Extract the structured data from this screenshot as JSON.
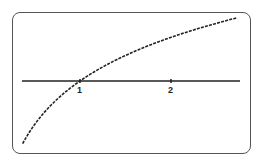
{
  "chart_data": {
    "type": "line",
    "title": "",
    "xlabel": "",
    "ylabel": "",
    "function": "y = ln(x)",
    "xlim": [
      0.37,
      2.72
    ],
    "ylim": [
      -1.0,
      1.0
    ],
    "x_ticks": [
      {
        "value": 1,
        "label": "1"
      },
      {
        "value": 2,
        "label": "2"
      }
    ],
    "series": [
      {
        "name": "ln(x)",
        "x": [
          0.37,
          0.5,
          0.75,
          1.0,
          1.25,
          1.5,
          1.75,
          2.0,
          2.25,
          2.5,
          2.72
        ],
        "y": [
          -1.0,
          -0.69,
          -0.29,
          0.0,
          0.22,
          0.41,
          0.56,
          0.69,
          0.81,
          0.92,
          1.0
        ]
      }
    ],
    "grid": false,
    "legend": null,
    "style": {
      "line_color": "#222222",
      "line_style": "dotted-pixel",
      "axis_color": "#222222",
      "frame_color": "#555555"
    }
  },
  "ticks": {
    "one": "1",
    "two": "2"
  }
}
